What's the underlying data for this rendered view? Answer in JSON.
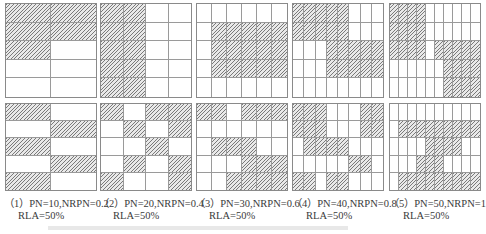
{
  "panels": [
    {
      "label": "（1）PN=10,NRPN=0.2",
      "rla": "RLA=50%",
      "cols": 2,
      "rows": 5,
      "top": [
        [
          1,
          1
        ],
        [
          1,
          1
        ],
        [
          1,
          0
        ],
        [
          0,
          0
        ],
        [
          0,
          0
        ]
      ],
      "bottom": [
        [
          1,
          0
        ],
        [
          0,
          1
        ],
        [
          1,
          0
        ],
        [
          0,
          1
        ],
        [
          1,
          0
        ]
      ]
    },
    {
      "label": "（2）PN=20,NRPN=0.4",
      "rla": "RLA=50%",
      "cols": 4,
      "rows": 5,
      "top": [
        [
          1,
          1,
          0,
          0
        ],
        [
          1,
          1,
          0,
          0
        ],
        [
          1,
          1,
          0,
          0
        ],
        [
          1,
          1,
          0,
          0
        ],
        [
          1,
          1,
          0,
          0
        ]
      ],
      "bottom": [
        [
          1,
          0,
          1,
          1
        ],
        [
          0,
          1,
          0,
          1
        ],
        [
          0,
          0,
          1,
          0
        ],
        [
          0,
          1,
          0,
          1
        ],
        [
          1,
          0,
          0,
          1
        ]
      ]
    },
    {
      "label": "（3）PN=30,NRPN=0.6",
      "rla": "RLA=50%",
      "cols": 6,
      "rows": 5,
      "top": [
        [
          0,
          0,
          0,
          0,
          0,
          0
        ],
        [
          0,
          1,
          1,
          1,
          1,
          1
        ],
        [
          0,
          1,
          1,
          1,
          1,
          1
        ],
        [
          0,
          1,
          1,
          1,
          1,
          1
        ],
        [
          0,
          0,
          0,
          0,
          0,
          0
        ]
      ],
      "bottom": [
        [
          1,
          1,
          0,
          1,
          1,
          1
        ],
        [
          0,
          0,
          0,
          0,
          0,
          0
        ],
        [
          0,
          1,
          1,
          1,
          0,
          0
        ],
        [
          0,
          0,
          0,
          1,
          1,
          1
        ],
        [
          0,
          0,
          1,
          1,
          1,
          1
        ]
      ]
    },
    {
      "label": "（4）PN=40,NRPN=0.8",
      "rla": "RLA=50%",
      "cols": 8,
      "rows": 5,
      "top": [
        [
          1,
          1,
          1,
          1,
          1,
          0,
          0,
          0
        ],
        [
          1,
          1,
          1,
          1,
          1,
          0,
          0,
          0
        ],
        [
          0,
          0,
          0,
          1,
          1,
          1,
          1,
          1
        ],
        [
          0,
          0,
          0,
          1,
          1,
          1,
          1,
          1
        ],
        [
          0,
          0,
          0,
          0,
          0,
          0,
          0,
          0
        ]
      ],
      "bottom": [
        [
          1,
          1,
          1,
          0,
          0,
          0,
          1,
          1
        ],
        [
          1,
          1,
          1,
          0,
          0,
          0,
          1,
          1
        ],
        [
          0,
          1,
          1,
          1,
          1,
          0,
          0,
          0
        ],
        [
          0,
          0,
          0,
          0,
          0,
          1,
          1,
          0
        ],
        [
          1,
          1,
          0,
          1,
          1,
          0,
          0,
          0
        ]
      ]
    },
    {
      "label": "（5）PN=50,NRPN=1",
      "rla": "RLA=50%",
      "cols": 10,
      "rows": 5,
      "top": [
        [
          1,
          1,
          1,
          1,
          0,
          0,
          0,
          0,
          0,
          0
        ],
        [
          1,
          1,
          1,
          1,
          0,
          0,
          0,
          0,
          0,
          0
        ],
        [
          1,
          1,
          1,
          1,
          0,
          1,
          1,
          1,
          1,
          1
        ],
        [
          0,
          0,
          0,
          0,
          0,
          0,
          1,
          1,
          1,
          1
        ],
        [
          0,
          0,
          0,
          0,
          0,
          0,
          1,
          1,
          1,
          1
        ]
      ],
      "bottom": [
        [
          0,
          0,
          0,
          0,
          0,
          0,
          0,
          0,
          0,
          0
        ],
        [
          0,
          1,
          1,
          1,
          1,
          1,
          1,
          1,
          1,
          1
        ],
        [
          0,
          0,
          0,
          0,
          1,
          1,
          1,
          1,
          0,
          0
        ],
        [
          0,
          0,
          0,
          1,
          1,
          1,
          0,
          0,
          0,
          0
        ],
        [
          0,
          1,
          1,
          1,
          1,
          1,
          1,
          1,
          1,
          1
        ]
      ]
    }
  ],
  "layout": {
    "x": [
      5,
      100,
      196,
      292,
      389
    ],
    "width": 92,
    "top_y": 3,
    "top_h": 95,
    "bottom_y": 103,
    "bottom_h": 88,
    "caption_y": 198,
    "caption_x": [
      4,
      99,
      195,
      292,
      389
    ]
  },
  "colors": {
    "hatch": "#7a7a7a",
    "grid_line": "#9a9a9a"
  }
}
